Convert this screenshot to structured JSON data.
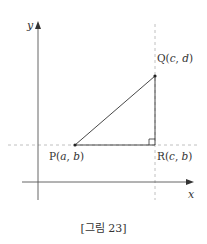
{
  "figure": {
    "caption": "[그림 23]",
    "axes": {
      "x_label": "x",
      "y_label": "y"
    },
    "points": [
      {
        "id": "P",
        "name": "P",
        "coords": [
          "a",
          "b"
        ]
      },
      {
        "id": "Q",
        "name": "Q",
        "coords": [
          "c",
          "d"
        ]
      },
      {
        "id": "R",
        "name": "R",
        "coords": [
          "c",
          "b"
        ]
      }
    ],
    "segments": [
      [
        "P",
        "Q"
      ],
      [
        "Q",
        "R"
      ],
      [
        "P",
        "R"
      ]
    ],
    "right_angle_at": "R",
    "guide_lines": [
      "horizontal through P and R (y = b)",
      "vertical through Q and R (x = c)"
    ],
    "colors": {
      "line": "#333333",
      "dashed": "#b0b0b0",
      "axis": "#555555"
    }
  }
}
